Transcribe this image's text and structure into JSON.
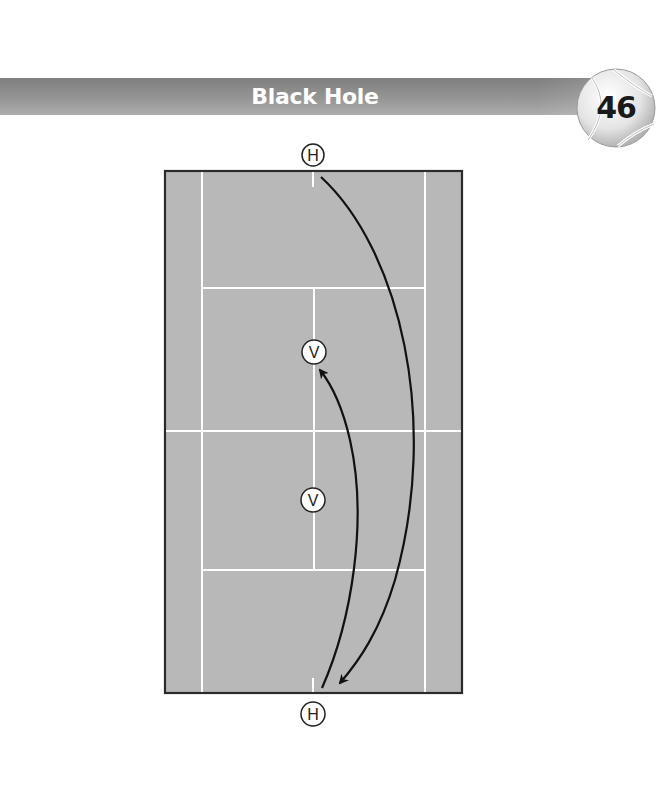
{
  "header": {
    "title": "Black Hole",
    "drill_number": "46"
  },
  "diagram": {
    "type": "tennis-court-drill",
    "court_color": "#b8b8b8",
    "line_color": "#ffffff",
    "border_color": "#2a2a2a",
    "players": [
      {
        "id": "hitter-top",
        "label": "H",
        "x": 313,
        "y": 155
      },
      {
        "id": "volleyer-top",
        "label": "V",
        "x": 314,
        "y": 352
      },
      {
        "id": "volleyer-bottom",
        "label": "V",
        "x": 313,
        "y": 500
      },
      {
        "id": "hitter-bottom",
        "label": "H",
        "x": 313,
        "y": 714
      }
    ],
    "paths": [
      {
        "id": "lob-shot",
        "from": "top-baseline",
        "to": "bottom-baseline",
        "description": "deep crosscourt curve to opposite baseline"
      },
      {
        "id": "return-shot",
        "from": "bottom-baseline",
        "to": "top-volleyer",
        "description": "curved shot back to net player"
      }
    ]
  }
}
